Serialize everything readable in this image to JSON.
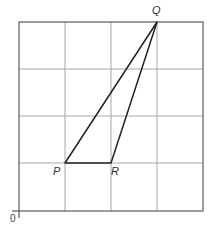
{
  "diagram": {
    "grid": {
      "columns": 4,
      "rows": 4
    },
    "origin_label": "0",
    "points": [
      {
        "name": "P",
        "label": "P",
        "grid_x": 1,
        "grid_y": 1
      },
      {
        "name": "Q",
        "label": "Q",
        "grid_x": 3,
        "grid_y": 4
      },
      {
        "name": "R",
        "label": "R",
        "grid_x": 2,
        "grid_y": 1
      }
    ],
    "triangle": [
      "P",
      "Q",
      "R"
    ],
    "colors": {
      "grid": "#9a9a9a",
      "border": "#555555",
      "triangle": "#222222",
      "label": "#333333"
    }
  }
}
